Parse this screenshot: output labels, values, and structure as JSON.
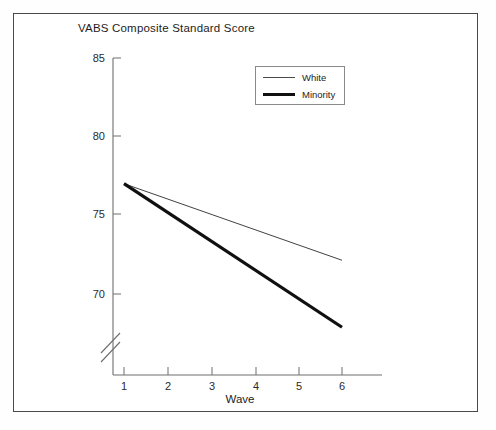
{
  "figure": {
    "title": "VABS Composite Standard Score",
    "x_axis_label": "Wave"
  },
  "legend": {
    "position": "top-right-inside",
    "entries": [
      {
        "label": "White",
        "style": "thin-line",
        "color": "#4a4a4a"
      },
      {
        "label": "Minority",
        "style": "thick-line",
        "color": "#101010"
      }
    ]
  },
  "axes": {
    "y_ticks": [
      "85",
      "80",
      "75",
      "70"
    ],
    "x_ticks": [
      "1",
      "2",
      "3",
      "4",
      "5",
      "6"
    ],
    "y_axis_break": true
  },
  "chart_data": {
    "type": "line",
    "title": "VABS Composite Standard Score",
    "xlabel": "Wave",
    "ylabel": "VABS Composite Standard Score",
    "x": [
      1,
      6
    ],
    "xlim": [
      0.5,
      6.5
    ],
    "ylim": [
      69,
      85
    ],
    "y_tick_values": [
      85,
      80,
      75,
      70
    ],
    "x_tick_values": [
      1,
      2,
      3,
      4,
      5,
      6
    ],
    "grid": false,
    "axis_break": "y-axis broken below 69",
    "legend_position": "upper right",
    "series": [
      {
        "name": "White",
        "values": [
          76.9,
          72.1
        ],
        "linewidth": "thin",
        "color": "#4a4a4a"
      },
      {
        "name": "Minority",
        "values": [
          76.9,
          67.9
        ],
        "linewidth": "thick",
        "color": "#101010"
      }
    ]
  }
}
